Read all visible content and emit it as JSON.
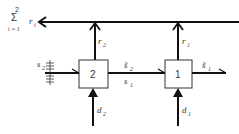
{
  "diagram": {
    "output": {
      "sum_top": "2",
      "sum_symbol": "Σ",
      "sum_bottom": "i = 1",
      "variable": "r",
      "subscript": "i"
    },
    "blocks": [
      {
        "id": "block-2",
        "label": "2"
      },
      {
        "id": "block-1",
        "label": "1"
      }
    ],
    "signals": {
      "input_state": {
        "base": "s",
        "sub": "2"
      },
      "intermediate_upper": {
        "base": "s̃",
        "sub": "2"
      },
      "intermediate_lower": {
        "base": "s",
        "sub": "1"
      },
      "final_output": {
        "base": "s̃",
        "sub": "1"
      },
      "return_2": {
        "base": "r",
        "sub": "2"
      },
      "return_1": {
        "base": "r",
        "sub": "1"
      },
      "decision_2": {
        "base": "d",
        "sub": "2"
      },
      "decision_1": {
        "base": "d",
        "sub": "1"
      }
    }
  }
}
